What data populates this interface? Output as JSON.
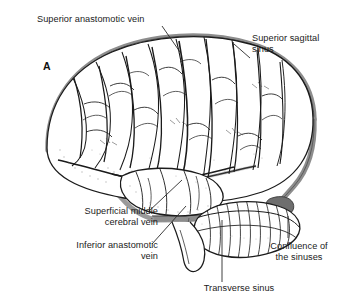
{
  "figure": {
    "panel_letter": "A",
    "colors": {
      "ink": "#1b1b1b",
      "sinus_gray": "#8d8d8d",
      "sinus_gray_dark": "#6e6e6e",
      "shading": "#b8b8b8",
      "background": "#ffffff",
      "leader": "#2a2a2a"
    }
  },
  "labels": {
    "superior_anastomotic_vein": "Superior anastomotic vein",
    "superior_sagittal_sinus": "Superior sagittal\nsinus",
    "superficial_middle_cerebral_vein": "Superficial middle\ncerebral vein",
    "inferior_anastomotic_vein": "Inferior anastomotic\nvein",
    "confluence_of_the_sinuses": "Confluence of\nthe sinuses",
    "transverse_sinus": "Transverse sinus"
  },
  "structures": [
    {
      "name": "cerebral-hemisphere",
      "type": "lateral-view-outline"
    },
    {
      "name": "cerebellum",
      "type": "folia-outline"
    },
    {
      "name": "superior-sagittal-sinus",
      "type": "dural-venous-sinus"
    },
    {
      "name": "transverse-sinus",
      "type": "dural-venous-sinus"
    },
    {
      "name": "sigmoid-sinus",
      "type": "dural-venous-sinus"
    },
    {
      "name": "confluence-of-sinuses",
      "type": "dural-venous-sinus"
    },
    {
      "name": "superior-anastomotic-vein",
      "type": "cortical-vein"
    },
    {
      "name": "inferior-anastomotic-vein",
      "type": "cortical-vein"
    },
    {
      "name": "superficial-middle-cerebral-vein",
      "type": "cortical-vein"
    }
  ]
}
